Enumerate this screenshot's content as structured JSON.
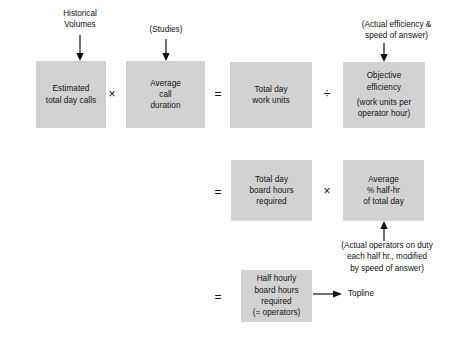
{
  "diagram": {
    "box_fill": "#d2d2d2",
    "ink": "#111111",
    "background": "#ffffff",
    "boxes": [
      {
        "id": "estimated-total-day-calls",
        "lines": [
          "Estimated",
          "total day calls"
        ]
      },
      {
        "id": "average-call-duration",
        "lines": [
          "Average",
          "call",
          "duration"
        ]
      },
      {
        "id": "total-day-work-units",
        "lines": [
          "Total day",
          "work units"
        ]
      },
      {
        "id": "objective-efficiency",
        "lines": [
          "Objective",
          "efficiency"
        ],
        "sub_lines": [
          "(work units per",
          "operator hour)"
        ]
      },
      {
        "id": "total-day-board-hours-required",
        "lines": [
          "Total day",
          "board hours",
          "required"
        ]
      },
      {
        "id": "average-pct-half-hr-of-total-day",
        "lines": [
          "Average",
          "% half-hr",
          "of total day"
        ]
      },
      {
        "id": "half-hourly-board-hours-required",
        "lines": [
          "Half hourly",
          "board hours",
          "required",
          "(= operators)"
        ]
      }
    ],
    "operators": {
      "multiply_top": "×",
      "equals_top": "=",
      "divide_top": "÷",
      "equals_middle": "=",
      "multiply_middle": "×",
      "equals_bottom": "="
    },
    "annotations": {
      "historical_volumes": [
        "Historical",
        "Volumes"
      ],
      "studies": [
        "(Studies)"
      ],
      "actual_efficiency": [
        "(Actual efficiency &",
        "speed of answer)"
      ],
      "actual_operators": [
        "(Actual operators on duty",
        "each half hr., modified",
        "by speed of answer)"
      ]
    },
    "output": {
      "label": "Topline"
    }
  }
}
